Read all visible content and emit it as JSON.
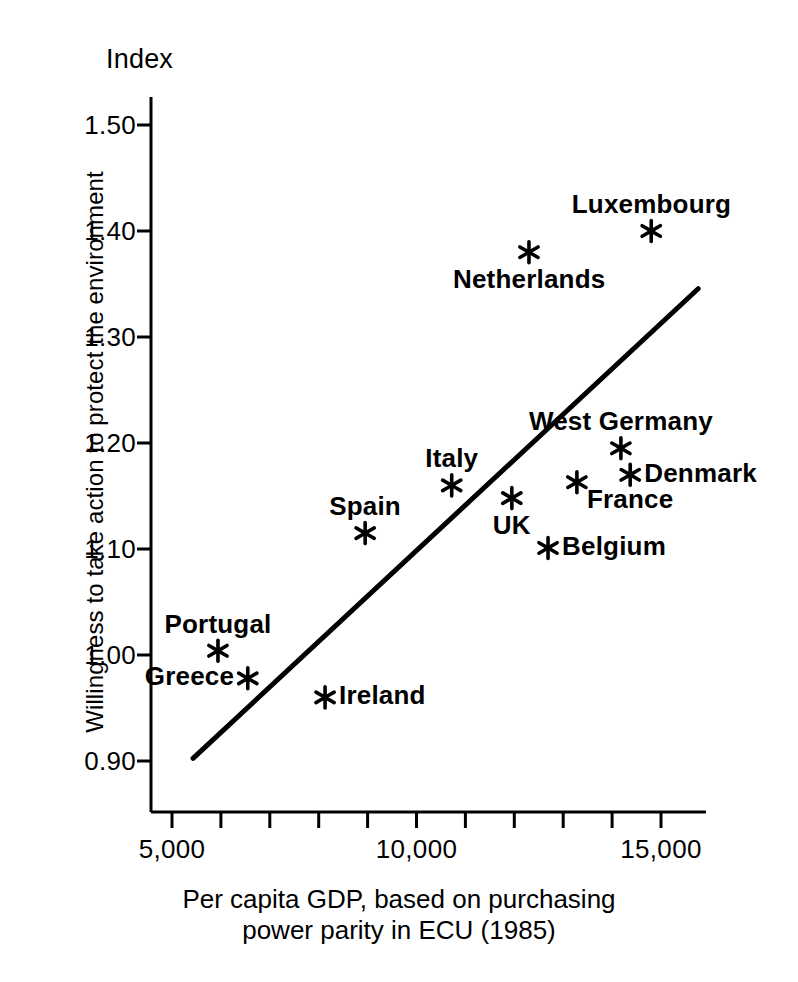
{
  "chart_data": {
    "type": "scatter",
    "title": "",
    "header_label": "Index",
    "xlabel": "Per capita GDP, based on purchasing power parity in ECU (1985)",
    "xlabel_line1": "Per capita GDP, based on purchasing",
    "xlabel_line2": "power parity in ECU (1985)",
    "ylabel": "Willingness to take action to protect the environment",
    "xlim": [
      4550,
      15750
    ],
    "ylim": [
      0.9,
      1.5
    ],
    "grid": false,
    "legend": false,
    "marker": "asterisk",
    "color": "#000000",
    "xticks": [
      5000,
      10000,
      15000
    ],
    "xtick_labels": [
      "5,000",
      "10,000",
      "15,000"
    ],
    "xminor_step": 1000,
    "yticks": [
      0.9,
      1.0,
      1.1,
      1.2,
      1.3,
      1.4,
      1.5
    ],
    "ytick_labels": [
      "0.90",
      "1.00",
      "1.10",
      "1.20",
      "1.30",
      "1.40",
      "1.50"
    ],
    "points": [
      {
        "label": "Luxembourg",
        "x": 14800,
        "y": 1.4,
        "label_pos": "above"
      },
      {
        "label": "Netherlands",
        "x": 12300,
        "y": 1.38,
        "label_pos": "below"
      },
      {
        "label": "West Germany",
        "x": 14180,
        "y": 1.195,
        "label_pos": "above"
      },
      {
        "label": "Denmark",
        "x": 14370,
        "y": 1.17,
        "label_pos": "right"
      },
      {
        "label": "France",
        "x": 13280,
        "y": 1.163,
        "label_pos": "below-right"
      },
      {
        "label": "Italy",
        "x": 10720,
        "y": 1.16,
        "label_pos": "above"
      },
      {
        "label": "UK",
        "x": 11950,
        "y": 1.148,
        "label_pos": "below"
      },
      {
        "label": "Belgium",
        "x": 12690,
        "y": 1.101,
        "label_pos": "right"
      },
      {
        "label": "Spain",
        "x": 8950,
        "y": 1.115,
        "label_pos": "above"
      },
      {
        "label": "Portugal",
        "x": 5940,
        "y": 1.004,
        "label_pos": "above"
      },
      {
        "label": "Greece",
        "x": 6550,
        "y": 0.978,
        "label_pos": "left"
      },
      {
        "label": "Ireland",
        "x": 8130,
        "y": 0.96,
        "label_pos": "right"
      }
    ],
    "trend_line": {
      "x_start": 5430,
      "y_start": 0.9025,
      "x_end": 15760,
      "y_end": 1.3455
    }
  }
}
